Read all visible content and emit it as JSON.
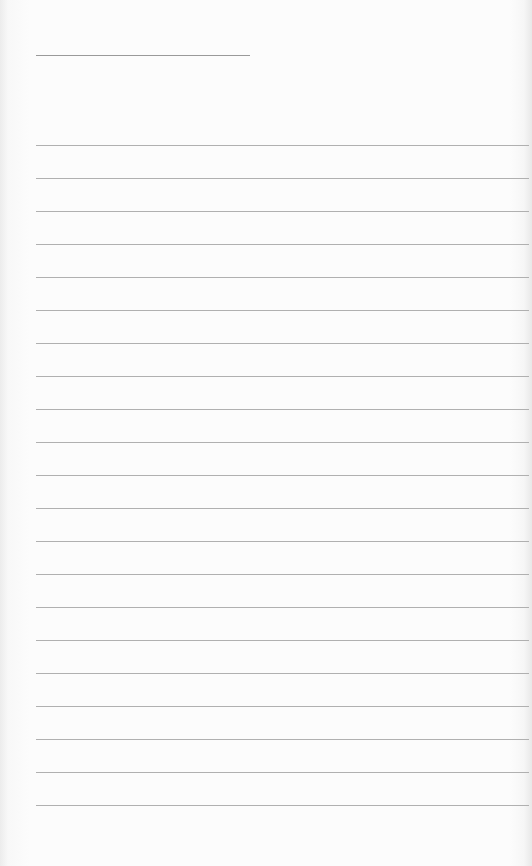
{
  "page": {
    "type": "lined-paper",
    "background_color": "#fbfbfb",
    "line_color": "#b0b0b0"
  },
  "header_line": {
    "x": 36,
    "y": 55,
    "width": 214
  },
  "ruled_lines": {
    "x": 36,
    "width": 493,
    "first_y": 145,
    "spacing": 33,
    "count": 21
  }
}
